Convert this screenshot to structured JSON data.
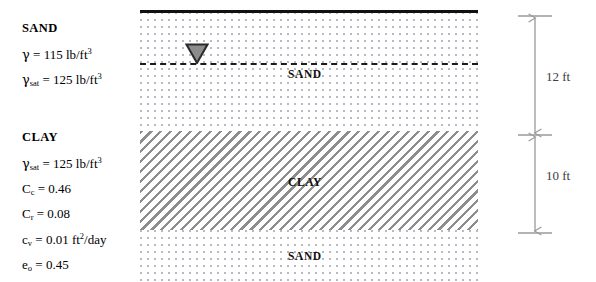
{
  "sand_properties": {
    "heading": "SAND",
    "unit_weight": {
      "symbol": "γ",
      "equals": " = ",
      "value": "115 lb/ft",
      "exponent": "3"
    },
    "saturated_unit_weight": {
      "symbol": "γ",
      "subscript": "sat",
      "equals": " = ",
      "value": "125 lb/ft",
      "exponent": "3"
    }
  },
  "clay_properties": {
    "heading": "CLAY",
    "saturated_unit_weight": {
      "symbol": "γ",
      "subscript": "sat",
      "equals": " = ",
      "value": "125 lb/ft",
      "exponent": "3"
    },
    "compression_index": {
      "symbol": "C",
      "subscript": "c",
      "equals": " = ",
      "value": "0.46"
    },
    "recompression_index": {
      "symbol": "C",
      "subscript": "r",
      "equals": " = ",
      "value": "0.08"
    },
    "coefficient_of_consolidation": {
      "symbol": "c",
      "subscript": "v",
      "equals": " = ",
      "value": "0.01 ft",
      "exponent": "2",
      "units_tail": "/day"
    },
    "initial_void_ratio": {
      "symbol": "e",
      "subscript": "o",
      "equals": " = ",
      "value": "0.45"
    }
  },
  "profile": {
    "top_layer_label": "SAND",
    "middle_layer_label": "CLAY",
    "bottom_layer_label": "SAND",
    "water_table_marker": "water-table-triangle"
  },
  "dimensions": {
    "upper": "12 ft",
    "lower": "10 ft"
  },
  "colors": {
    "ground_surface": "#111111",
    "water_table_line": "#1a1a1a",
    "water_table_triangle": "#8c8c8c",
    "clay_hatch": "#8d8d8d",
    "sand_stipple": "#b9b9c4",
    "dimension_line": "#9a9a9a",
    "dimension_text": "#3d3d3d"
  }
}
